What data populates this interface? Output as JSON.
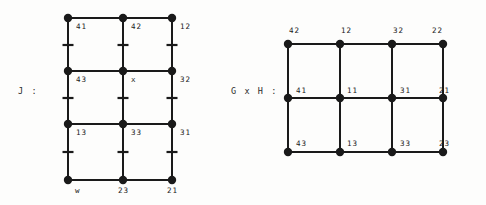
{
  "figure": {
    "background_color": "#fdfdfc",
    "ink_color": "#1a1a1a",
    "left": {
      "caption": "J :",
      "caption_x": 18,
      "caption_y": 86,
      "grid": {
        "type": "lattice-graph",
        "cols": 3,
        "rows": 4,
        "col_x": [
          68,
          123,
          172
        ],
        "row_y": [
          18,
          71,
          124,
          180
        ],
        "node_radius": 4.2,
        "edge_width": 2.0,
        "tick_rows_y": [
          45,
          98,
          152
        ],
        "tick_half_width": 5.5
      },
      "nodes": [
        {
          "label": "41",
          "col": 0,
          "row": 0,
          "lx": 76,
          "ly": 22
        },
        {
          "label": "42",
          "col": 1,
          "row": 0,
          "lx": 131,
          "ly": 22
        },
        {
          "label": "12",
          "col": 2,
          "row": 0,
          "lx": 180,
          "ly": 22
        },
        {
          "label": "43",
          "col": 0,
          "row": 1,
          "lx": 76,
          "ly": 75
        },
        {
          "label": "x",
          "col": 1,
          "row": 1,
          "lx": 131,
          "ly": 75
        },
        {
          "label": "32",
          "col": 2,
          "row": 1,
          "lx": 180,
          "ly": 75
        },
        {
          "label": "13",
          "col": 0,
          "row": 2,
          "lx": 76,
          "ly": 128
        },
        {
          "label": "33",
          "col": 1,
          "row": 2,
          "lx": 131,
          "ly": 128
        },
        {
          "label": "31",
          "col": 2,
          "row": 2,
          "lx": 180,
          "ly": 128
        },
        {
          "label": "w",
          "col": 0,
          "row": 3,
          "lx": 75,
          "ly": 186
        },
        {
          "label": "23",
          "col": 1,
          "row": 3,
          "lx": 118,
          "ly": 186
        },
        {
          "label": "21",
          "col": 2,
          "row": 3,
          "lx": 167,
          "ly": 186
        }
      ]
    },
    "right": {
      "caption": "G x H :",
      "caption_x": 231,
      "caption_y": 86,
      "grid": {
        "type": "lattice-graph",
        "cols": 4,
        "rows": 3,
        "col_x": [
          288,
          340,
          392,
          443
        ],
        "row_y": [
          44,
          98,
          152
        ],
        "node_radius": 4.2,
        "edge_width": 2.0
      },
      "nodes": [
        {
          "label": "42",
          "col": 0,
          "row": 0,
          "lx": 289,
          "ly": 26
        },
        {
          "label": "12",
          "col": 1,
          "row": 0,
          "lx": 341,
          "ly": 26
        },
        {
          "label": "32",
          "col": 2,
          "row": 0,
          "lx": 393,
          "ly": 26
        },
        {
          "label": "22",
          "col": 3,
          "row": 0,
          "lx": 432,
          "ly": 26
        },
        {
          "label": "41",
          "col": 0,
          "row": 1,
          "lx": 296,
          "ly": 86
        },
        {
          "label": "11",
          "col": 1,
          "row": 1,
          "lx": 347,
          "ly": 86
        },
        {
          "label": "31",
          "col": 2,
          "row": 1,
          "lx": 400,
          "ly": 86
        },
        {
          "label": "21",
          "col": 3,
          "row": 1,
          "lx": 439,
          "ly": 86
        },
        {
          "label": "43",
          "col": 0,
          "row": 2,
          "lx": 296,
          "ly": 139
        },
        {
          "label": "13",
          "col": 1,
          "row": 2,
          "lx": 347,
          "ly": 139
        },
        {
          "label": "33",
          "col": 2,
          "row": 2,
          "lx": 400,
          "ly": 139
        },
        {
          "label": "23",
          "col": 3,
          "row": 2,
          "lx": 439,
          "ly": 139
        }
      ]
    }
  }
}
